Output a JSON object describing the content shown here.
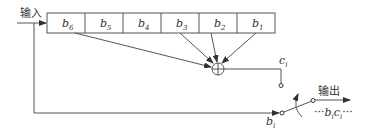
{
  "diagram": {
    "input_label": "输入",
    "output_label": "输出",
    "register_cells": [
      {
        "base": "b",
        "sub": "6"
      },
      {
        "base": "b",
        "sub": "5"
      },
      {
        "base": "b",
        "sub": "4"
      },
      {
        "base": "b",
        "sub": "3"
      },
      {
        "base": "b",
        "sub": "2"
      },
      {
        "base": "b",
        "sub": "1"
      }
    ],
    "xor_node": "⊕",
    "check_bit": {
      "base": "c",
      "sub": "i"
    },
    "info_bit": {
      "base": "b",
      "sub": "i"
    },
    "output_sequence": {
      "prefix": "···",
      "b": "b",
      "b_sub": "i",
      "c": "c",
      "c_sub": "i",
      "suffix": "···"
    },
    "colors": {
      "line": "#555555",
      "text": "#333333",
      "background": "#ffffff"
    }
  }
}
